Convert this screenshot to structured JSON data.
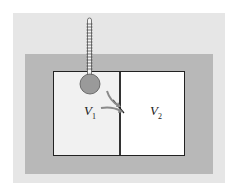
{
  "diagram": {
    "labels": {
      "v1": {
        "symbol": "V",
        "subscript": "1"
      },
      "v2": {
        "symbol": "V",
        "subscript": "2"
      }
    },
    "colors": {
      "outer_panel": "#e6e6e6",
      "insulation_band": "#b8b8b8",
      "left_chamber": "#f1f1f1",
      "right_chamber": "#ffffff",
      "thermometer_bulb": "#9a9a9a",
      "arrows": "#8a8a8a"
    }
  }
}
